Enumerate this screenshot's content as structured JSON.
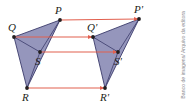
{
  "figure": {
    "background_color": "#ffffff",
    "shape_fill_color": "#8f90b8",
    "shape_stroke_color": "#3b3b6b",
    "arrow_color": "#e2604f",
    "point_color": "#231f20",
    "label_color": "#231f20"
  },
  "shapes": [
    {
      "name": "original-figure",
      "id": "shape-pqrs",
      "polygon_points": "60,20 14,37 27,88",
      "inner_segments": [
        {
          "from": "60,20",
          "to": "40,52"
        },
        {
          "from": "40,52",
          "to": "14,37"
        },
        {
          "from": "40,52",
          "to": "27,88"
        }
      ]
    },
    {
      "name": "translated-figure",
      "id": "shape-pqrs-prime",
      "polygon_points": "139,19 93,37 105,88",
      "inner_segments": [
        {
          "from": "139,19",
          "to": "118,52"
        },
        {
          "from": "118,52",
          "to": "93,37"
        },
        {
          "from": "118,52",
          "to": "105,88"
        }
      ]
    }
  ],
  "points": [
    {
      "name": "point-P",
      "label": "P",
      "x": 60,
      "y": 20,
      "label_x": 55,
      "label_y": 5
    },
    {
      "name": "point-Q",
      "label": "Q",
      "x": 14,
      "y": 37,
      "label_x": 8,
      "label_y": 22
    },
    {
      "name": "point-S",
      "label": "S",
      "x": 40,
      "y": 52,
      "label_x": 35,
      "label_y": 56
    },
    {
      "name": "point-R",
      "label": "R",
      "x": 27,
      "y": 88,
      "label_x": 22,
      "label_y": 92
    },
    {
      "name": "point-P-prime",
      "label": "P'",
      "x": 139,
      "y": 19,
      "label_x": 134,
      "label_y": 4
    },
    {
      "name": "point-Q-prime",
      "label": "Q'",
      "x": 93,
      "y": 37,
      "label_x": 87,
      "label_y": 22
    },
    {
      "name": "point-S-prime",
      "label": "S'",
      "x": 118,
      "y": 52,
      "label_x": 114,
      "label_y": 56
    },
    {
      "name": "point-R-prime",
      "label": "R'",
      "x": 105,
      "y": 88,
      "label_x": 100,
      "label_y": 92
    }
  ],
  "arrows": [
    {
      "name": "translation-arrow-P",
      "from_label": "P",
      "to_label": "P'",
      "x1": 61,
      "y1": 20,
      "x2": 138,
      "y2": 19
    },
    {
      "name": "translation-arrow-Q",
      "from_label": "Q",
      "to_label": "Q'",
      "x1": 15,
      "y1": 37,
      "x2": 92,
      "y2": 37
    },
    {
      "name": "translation-arrow-S",
      "from_label": "S",
      "to_label": "S'",
      "x1": 41,
      "y1": 52,
      "x2": 117,
      "y2": 52
    },
    {
      "name": "translation-arrow-R",
      "from_label": "R",
      "to_label": "R'",
      "x1": 28,
      "y1": 88,
      "x2": 104,
      "y2": 88
    }
  ],
  "credit": {
    "text": "Banco de imagens/ Arquivo da editora"
  }
}
